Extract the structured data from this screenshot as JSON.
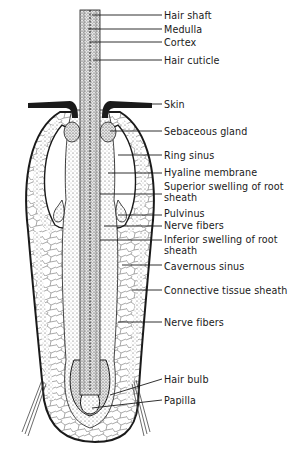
{
  "figure": {
    "colors": {
      "ink": "#1a1a1a",
      "background": "#ffffff",
      "stipple": "#555555"
    }
  },
  "labels": [
    {
      "id": "hair-shaft",
      "text": "Hair shaft",
      "x": 164,
      "y": 10,
      "line": [
        92,
        15,
        162,
        15
      ]
    },
    {
      "id": "medulla",
      "text": "Medulla",
      "x": 164,
      "y": 24,
      "line": [
        88,
        29,
        162,
        29
      ]
    },
    {
      "id": "cortex",
      "text": "Cortex",
      "x": 164,
      "y": 37,
      "line": [
        90,
        42,
        162,
        42
      ]
    },
    {
      "id": "hair-cuticle",
      "text": "Hair cuticle",
      "x": 164,
      "y": 55,
      "line": [
        93,
        60,
        162,
        60
      ]
    },
    {
      "id": "skin",
      "text": "Skin",
      "x": 164,
      "y": 99,
      "line": [
        150,
        104,
        162,
        104
      ]
    },
    {
      "id": "sebaceous-gland",
      "text": "Sebaceous gland",
      "x": 164,
      "y": 126,
      "line": [
        110,
        131,
        162,
        131
      ]
    },
    {
      "id": "ring-sinus",
      "text": "Ring sinus",
      "x": 164,
      "y": 150,
      "line": [
        118,
        155,
        162,
        155
      ]
    },
    {
      "id": "hyaline-membrane",
      "text": "Hyaline membrane",
      "x": 164,
      "y": 167,
      "line": [
        108,
        173,
        162,
        173
      ]
    },
    {
      "id": "superior-swelling",
      "text": "Superior swelling of root sheath",
      "x": 164,
      "y": 181,
      "line": [
        100,
        194,
        162,
        194
      ]
    },
    {
      "id": "pulvinus",
      "text": "Pulvinus",
      "x": 164,
      "y": 208,
      "line": [
        118,
        215,
        162,
        215
      ]
    },
    {
      "id": "nerve-fibers-upper",
      "text": "Nerve fibers",
      "x": 164,
      "y": 220,
      "line": [
        104,
        226,
        162,
        226
      ]
    },
    {
      "id": "inferior-swelling",
      "text": "Inferior swelling of root sheath",
      "x": 164,
      "y": 234,
      "line": [
        100,
        240,
        162,
        240
      ]
    },
    {
      "id": "cavernous-sinus",
      "text": "Cavernous sinus",
      "x": 164,
      "y": 261,
      "line": [
        122,
        265,
        162,
        265
      ]
    },
    {
      "id": "connective-tissue-sheath",
      "text": "Connective tissue sheath",
      "x": 164,
      "y": 285,
      "line": [
        132,
        290,
        162,
        290
      ]
    },
    {
      "id": "nerve-fibers-lower",
      "text": "Nerve fibers",
      "x": 164,
      "y": 317,
      "line": [
        118,
        322,
        162,
        322
      ]
    },
    {
      "id": "hair-bulb",
      "text": "Hair bulb",
      "x": 164,
      "y": 374,
      "line": [
        110,
        395,
        162,
        379
      ]
    },
    {
      "id": "papilla",
      "text": "Papilla",
      "x": 164,
      "y": 395,
      "line": [
        92,
        408,
        162,
        400
      ]
    }
  ]
}
